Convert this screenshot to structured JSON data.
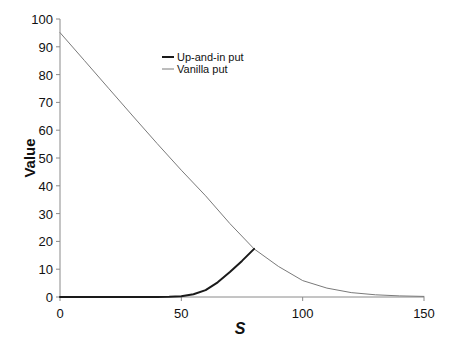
{
  "chart_data": {
    "type": "line",
    "title": "",
    "xlabel": "S",
    "ylabel": "Value",
    "xlim": [
      0,
      150
    ],
    "ylim": [
      0,
      100
    ],
    "xticks": [
      0,
      50,
      100,
      150
    ],
    "yticks": [
      0,
      10,
      20,
      30,
      40,
      50,
      60,
      70,
      80,
      90,
      100
    ],
    "grid": false,
    "legend_position": "upper-center",
    "series": [
      {
        "name": "Up-and-in put",
        "color": "#1a1a1a",
        "line_width": 2,
        "x": [
          0,
          10,
          20,
          30,
          40,
          45,
          50,
          55,
          60,
          65,
          70,
          75,
          80
        ],
        "y": [
          0,
          0,
          0,
          0,
          0.02,
          0.1,
          0.3,
          1.0,
          2.5,
          5.3,
          9.0,
          13.0,
          17.3
        ]
      },
      {
        "name": "Vanilla put",
        "color": "#7a7a7a",
        "line_width": 1,
        "x": [
          0,
          10,
          20,
          30,
          40,
          50,
          60,
          70,
          80,
          90,
          100,
          110,
          120,
          130,
          140,
          150
        ],
        "y": [
          95.1,
          85.1,
          75.1,
          65.1,
          55.2,
          45.6,
          36.4,
          26.4,
          17.3,
          11.0,
          5.9,
          3.2,
          1.6,
          0.8,
          0.4,
          0.2
        ]
      }
    ]
  }
}
